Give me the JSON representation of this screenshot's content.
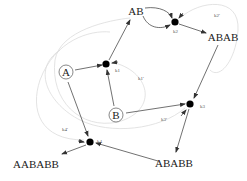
{
  "diagram": {
    "type": "reaction-network",
    "species": [
      {
        "id": "A",
        "label": "A",
        "circled": true,
        "x": 66,
        "y": 72
      },
      {
        "id": "B",
        "label": "B",
        "circled": true,
        "x": 116,
        "y": 115
      },
      {
        "id": "AB",
        "label": "AB",
        "circled": false,
        "x": 136,
        "y": 11
      },
      {
        "id": "ABAB",
        "label": "ABAB",
        "circled": false,
        "x": 223,
        "y": 37
      },
      {
        "id": "ABABB",
        "label": "ABABB",
        "circled": false,
        "x": 174,
        "y": 163
      },
      {
        "id": "AABABB",
        "label": "AABABB",
        "circled": false,
        "x": 33,
        "y": 164
      }
    ],
    "reaction_nodes": [
      {
        "id": "r1",
        "x": 106,
        "y": 64,
        "forward_label": "k1",
        "reverse_label": "k1'"
      },
      {
        "id": "r2",
        "x": 175,
        "y": 22,
        "forward_label": "k2",
        "reverse_label": "k2'"
      },
      {
        "id": "r3",
        "x": 190,
        "y": 104,
        "forward_label": "k3",
        "reverse_label": "k3'"
      },
      {
        "id": "r4",
        "x": 90,
        "y": 142,
        "forward_label": "k4",
        "reverse_label": "k4'"
      }
    ],
    "labels": {
      "k1": "k1",
      "k1r": "k1'",
      "k2": "k2",
      "k2r": "k2'",
      "k3": "k3",
      "k3r": "k3'",
      "k4": "k4",
      "k4r": "k4'"
    },
    "edges": [
      {
        "from": "A",
        "to": "r1"
      },
      {
        "from": "B",
        "to": "r1"
      },
      {
        "from": "r1",
        "to": "AB"
      },
      {
        "from": "AB",
        "to": "r2",
        "note": "two arcs"
      },
      {
        "from": "r2",
        "to": "ABAB"
      },
      {
        "from": "ABAB",
        "to": "r3"
      },
      {
        "from": "B",
        "to": "r3"
      },
      {
        "from": "r3",
        "to": "ABABB"
      },
      {
        "from": "ABABB",
        "to": "r4"
      },
      {
        "from": "A",
        "to": "r4"
      },
      {
        "from": "r4",
        "to": "AABABB"
      }
    ],
    "colors": {
      "edge": "#333333",
      "reverse_curve": "#d8d8d8",
      "node": "#000000"
    }
  }
}
